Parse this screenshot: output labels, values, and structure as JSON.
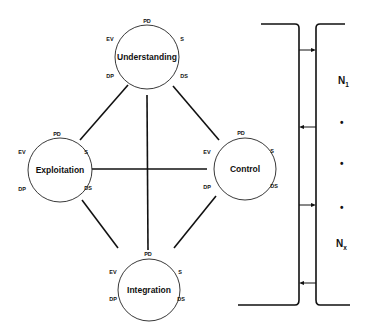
{
  "diagram": {
    "nodes": [
      {
        "id": "understanding",
        "label": "Understanding",
        "ports": {
          "top": "PD",
          "upper_left": "EV",
          "upper_right": "S",
          "lower_left": "DP",
          "lower_right": "DS"
        }
      },
      {
        "id": "exploitation",
        "label": "Exploitation",
        "ports": {
          "top": "PD",
          "upper_left": "EV",
          "upper_right": "S",
          "lower_left": "DP",
          "lower_right": "DS"
        }
      },
      {
        "id": "control",
        "label": "Control",
        "ports": {
          "top": "PD",
          "upper_left": "EV",
          "upper_right": "S",
          "lower_left": "DP",
          "lower_right": "DS"
        }
      },
      {
        "id": "integration",
        "label": "Integration",
        "ports": {
          "top": "PD",
          "upper_left": "EV",
          "upper_right": "S",
          "lower_left": "DP",
          "lower_right": "DS"
        }
      }
    ],
    "edges": [
      {
        "from": "understanding",
        "to": "exploitation"
      },
      {
        "from": "understanding",
        "to": "control"
      },
      {
        "from": "understanding",
        "to": "integration"
      },
      {
        "from": "exploitation",
        "to": "control"
      },
      {
        "from": "exploitation",
        "to": "integration"
      },
      {
        "from": "control",
        "to": "integration"
      }
    ],
    "bus": {
      "labels": {
        "first": "N",
        "first_sub": "1",
        "last": "N",
        "last_sub": "x",
        "ellipsis": [
          "•",
          "•",
          "•"
        ]
      },
      "arrows": [
        "right",
        "left",
        "right",
        "left"
      ]
    }
  }
}
